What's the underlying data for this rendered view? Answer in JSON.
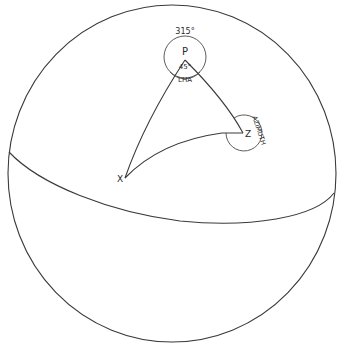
{
  "diagram": {
    "type": "celestial-sphere-navigational-triangle",
    "stroke_color": "#3a3a3a",
    "background": "#ffffff",
    "vertices": {
      "pole": {
        "label": "P"
      },
      "zenith": {
        "label": "Z"
      },
      "body": {
        "label": "X"
      }
    },
    "angles": {
      "lha_value": "45°",
      "lha_label": "LHA",
      "outer_value": "315°",
      "azimuth_label": "AZIMUTH"
    },
    "elements": [
      "sphere-outline",
      "equator",
      "side-PZ",
      "side-PX",
      "side-XZ",
      "angle-arc-P",
      "angle-arc-Z"
    ]
  }
}
